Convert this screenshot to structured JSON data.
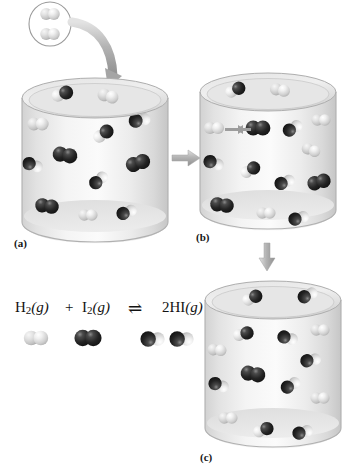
{
  "figure": {
    "background_color": "#ffffff"
  },
  "colors": {
    "dark_atom": "#262626",
    "light_atom": "#d8d8d8",
    "cylinder_body": "#e9e9e9",
    "cylinder_rim": "#b9b9b9",
    "arrow_gray": "#b0b0b0",
    "text": "#121212"
  },
  "legend": {
    "species": [
      {
        "name": "hydrogen-molecule",
        "formula": "H2",
        "atom_colors": [
          "light",
          "light"
        ]
      },
      {
        "name": "iodine-molecule",
        "formula": "I2",
        "atom_colors": [
          "dark",
          "dark"
        ]
      },
      {
        "name": "hydrogen-iodide-molecule",
        "formula": "HI",
        "atom_colors": [
          "light",
          "dark"
        ]
      }
    ]
  },
  "equation": {
    "reactant_1": "H",
    "reactant_1_sub": "2",
    "reactant_1_state": "(g)",
    "plus": "+",
    "reactant_2": "I",
    "reactant_2_sub": "2",
    "reactant_2_state": "(g)",
    "equilibrium_arrow": "⇌",
    "product": "2HI",
    "product_state": "(g)",
    "full_text": "H2(g) + I2(g) ⇌ 2HI(g)"
  },
  "panels": [
    {
      "id": "a",
      "label": "(a)",
      "caption": "Initial mixture: H2 and I2 molecules added to the vessel",
      "molecules": [
        {
          "type": "HI",
          "x": 62,
          "y": 94,
          "rot": -20,
          "scale": 1.0
        },
        {
          "type": "H2",
          "x": 108,
          "y": 96,
          "rot": 15,
          "scale": 1.0
        },
        {
          "type": "H2",
          "x": 38,
          "y": 124,
          "rot": 0,
          "scale": 1.0
        },
        {
          "type": "HI",
          "x": 140,
          "y": 120,
          "rot": 170,
          "scale": 1.0
        },
        {
          "type": "HI",
          "x": 103,
          "y": 134,
          "rot": -35,
          "scale": 1.0
        },
        {
          "type": "I2",
          "x": 65,
          "y": 155,
          "rot": 10,
          "scale": 1.05
        },
        {
          "type": "HI",
          "x": 33,
          "y": 165,
          "rot": 200,
          "scale": 0.95
        },
        {
          "type": "I2",
          "x": 138,
          "y": 163,
          "rot": -18,
          "scale": 1.05
        },
        {
          "type": "HI",
          "x": 99,
          "y": 180,
          "rot": 140,
          "scale": 0.95
        },
        {
          "type": "I2",
          "x": 47,
          "y": 206,
          "rot": 8,
          "scale": 1.0
        },
        {
          "type": "H2",
          "x": 88,
          "y": 215,
          "rot": 0,
          "scale": 0.9
        },
        {
          "type": "HI",
          "x": 127,
          "y": 212,
          "rot": 160,
          "scale": 0.95
        }
      ]
    },
    {
      "id": "b",
      "label": "(b)",
      "caption": "Collision: an H2 molecule and an I2 molecule approach each other",
      "collision_arrows": true,
      "molecules": [
        {
          "type": "HI",
          "x": 235,
          "y": 90,
          "rot": -25,
          "scale": 0.95
        },
        {
          "type": "H2",
          "x": 280,
          "y": 90,
          "rot": 10,
          "scale": 0.95
        },
        {
          "type": "H2",
          "x": 214,
          "y": 128,
          "rot": 0,
          "scale": 0.95
        },
        {
          "type": "I2",
          "x": 258,
          "y": 128,
          "rot": 0,
          "scale": 1.05
        },
        {
          "type": "HI",
          "x": 293,
          "y": 128,
          "rot": 150,
          "scale": 0.95
        },
        {
          "type": "H2",
          "x": 321,
          "y": 120,
          "rot": 0,
          "scale": 0.9
        },
        {
          "type": "H2",
          "x": 311,
          "y": 150,
          "rot": 20,
          "scale": 0.9
        },
        {
          "type": "HI",
          "x": 214,
          "y": 163,
          "rot": 200,
          "scale": 0.95
        },
        {
          "type": "HI",
          "x": 250,
          "y": 170,
          "rot": -30,
          "scale": 0.95
        },
        {
          "type": "HI",
          "x": 285,
          "y": 182,
          "rot": 160,
          "scale": 0.95
        },
        {
          "type": "I2",
          "x": 319,
          "y": 182,
          "rot": -15,
          "scale": 1.0
        },
        {
          "type": "I2",
          "x": 222,
          "y": 205,
          "rot": 8,
          "scale": 1.0
        },
        {
          "type": "H2",
          "x": 266,
          "y": 213,
          "rot": 0,
          "scale": 0.9
        },
        {
          "type": "HI",
          "x": 299,
          "y": 218,
          "rot": 165,
          "scale": 0.95
        }
      ]
    },
    {
      "id": "c",
      "label": "(c)",
      "caption": "Equilibrium mixture: mostly HI molecules with some H2 and I2 remaining",
      "molecules": [
        {
          "type": "HI",
          "x": 252,
          "y": 298,
          "rot": -25,
          "scale": 0.95
        },
        {
          "type": "HI",
          "x": 308,
          "y": 295,
          "rot": 155,
          "scale": 0.95
        },
        {
          "type": "HI",
          "x": 243,
          "y": 334,
          "rot": -15,
          "scale": 0.95
        },
        {
          "type": "HI",
          "x": 288,
          "y": 338,
          "rot": 195,
          "scale": 0.95
        },
        {
          "type": "H2",
          "x": 320,
          "y": 330,
          "rot": 0,
          "scale": 0.9
        },
        {
          "type": "H2",
          "x": 217,
          "y": 350,
          "rot": 5,
          "scale": 0.9
        },
        {
          "type": "HI",
          "x": 311,
          "y": 360,
          "rot": 170,
          "scale": 0.95
        },
        {
          "type": "I2",
          "x": 253,
          "y": 374,
          "rot": 10,
          "scale": 1.05
        },
        {
          "type": "HI",
          "x": 219,
          "y": 385,
          "rot": 200,
          "scale": 0.95
        },
        {
          "type": "HI",
          "x": 291,
          "y": 385,
          "rot": 150,
          "scale": 0.95
        },
        {
          "type": "H2",
          "x": 320,
          "y": 398,
          "rot": 0,
          "scale": 0.9
        },
        {
          "type": "H2",
          "x": 228,
          "y": 418,
          "rot": 0,
          "scale": 0.9
        },
        {
          "type": "HI",
          "x": 263,
          "y": 430,
          "rot": -20,
          "scale": 0.95
        },
        {
          "type": "HI",
          "x": 303,
          "y": 432,
          "rot": 165,
          "scale": 0.95
        }
      ]
    }
  ],
  "inset": {
    "name": "added-hydrogen-inset",
    "description": "Oval callout showing two H2 molecules being added",
    "molecules": [
      "H2",
      "H2"
    ]
  },
  "connector_arrows": [
    {
      "name": "inset-to-vessel-a",
      "direction": "curved-down-right"
    },
    {
      "name": "a-to-b",
      "direction": "right"
    },
    {
      "name": "b-to-c",
      "direction": "down"
    }
  ]
}
